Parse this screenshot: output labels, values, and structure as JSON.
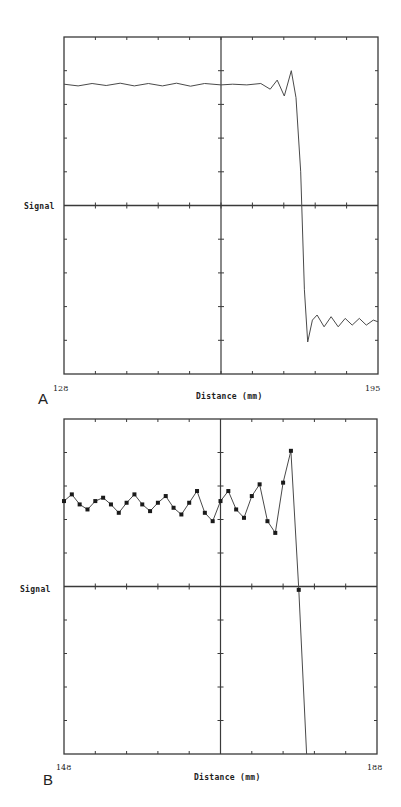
{
  "chart_data": [
    {
      "panel": "A",
      "type": "line",
      "title": "",
      "xlabel": "Distance (mm)",
      "ylabel": "Signal",
      "xlim": [
        128,
        195
      ],
      "ylim": [
        -5,
        5
      ],
      "x_tick_labels": [
        "128",
        "195"
      ],
      "grid": false,
      "crosshair": {
        "x": 161.5,
        "y": 0
      },
      "markers": false,
      "series": [
        {
          "name": "Signal",
          "x": [
            128,
            131,
            134,
            137,
            140,
            143,
            146,
            149,
            152,
            155,
            158,
            161.5,
            164,
            167,
            170,
            172,
            173.5,
            175,
            176.5,
            177.5,
            178.5,
            179.3,
            180,
            181,
            182,
            183.5,
            185,
            186.5,
            188,
            189.5,
            191,
            192.5,
            194,
            195
          ],
          "y": [
            3.6,
            3.55,
            3.62,
            3.56,
            3.63,
            3.55,
            3.62,
            3.55,
            3.63,
            3.54,
            3.62,
            3.58,
            3.6,
            3.58,
            3.62,
            3.45,
            3.72,
            3.25,
            4.0,
            3.2,
            1.0,
            -2.5,
            -4.05,
            -3.4,
            -3.25,
            -3.6,
            -3.3,
            -3.6,
            -3.35,
            -3.55,
            -3.35,
            -3.55,
            -3.4,
            -3.45
          ]
        }
      ]
    },
    {
      "panel": "B",
      "type": "line",
      "title": "",
      "xlabel": "Distance (mm)",
      "ylabel": "Signal",
      "xlim": [
        148,
        188
      ],
      "ylim": [
        -5,
        5
      ],
      "x_tick_labels": [
        "148",
        "188"
      ],
      "grid": false,
      "crosshair": {
        "x": 168,
        "y": 0
      },
      "markers": true,
      "series": [
        {
          "name": "Signal (sampled)",
          "x": [
            148,
            149,
            150,
            151,
            152,
            153,
            154,
            155,
            156,
            157,
            158,
            159,
            160,
            161,
            162,
            163,
            164,
            165,
            166,
            167,
            168,
            169,
            170,
            171,
            172,
            173,
            174,
            175,
            176,
            177,
            178,
            179
          ],
          "y": [
            2.55,
            2.75,
            2.45,
            2.3,
            2.55,
            2.65,
            2.45,
            2.2,
            2.5,
            2.75,
            2.45,
            2.25,
            2.5,
            2.7,
            2.35,
            2.15,
            2.5,
            2.85,
            2.2,
            1.95,
            2.55,
            2.85,
            2.3,
            2.05,
            2.7,
            3.05,
            1.95,
            1.6,
            3.1,
            4.05,
            -0.1,
            -5.0
          ]
        }
      ]
    }
  ],
  "panels": {
    "A": {
      "letter": "A",
      "ylabel": "Signal",
      "xlabel": "Distance (mm)",
      "xmin_label": "128",
      "xmax_label": "195"
    },
    "B": {
      "letter": "B",
      "ylabel": "Signal",
      "xlabel": "Distance (mm)",
      "xmin_label": "148",
      "xmax_label": "188"
    }
  },
  "colors": {
    "axis": "#3a3a3a",
    "line": "#4a4a4a",
    "marker": "#1a1a1a",
    "background": "#ffffff"
  }
}
